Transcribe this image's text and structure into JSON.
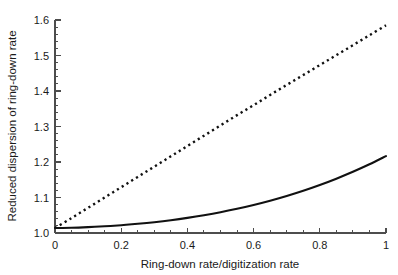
{
  "chart_data": {
    "type": "line",
    "title": "",
    "xlabel": "Ring-down rate/digitization rate",
    "ylabel": "Reduced dispersion of ring-down rate",
    "xlim": [
      0,
      1
    ],
    "ylim": [
      1.0,
      1.6
    ],
    "grid": false,
    "legend": "none",
    "x_ticks": [
      0,
      0.2,
      0.4,
      0.6,
      0.8,
      1
    ],
    "x_tick_labels": [
      "0",
      "0.2",
      "0.4",
      "0.6",
      "0.8",
      "1"
    ],
    "x_minor_step": 0.05,
    "y_ticks": [
      1.0,
      1.1,
      1.2,
      1.3,
      1.4,
      1.5,
      1.6
    ],
    "y_tick_labels": [
      "1.0",
      "1.1",
      "1.2",
      "1.3",
      "1.4",
      "1.5",
      "1.6"
    ],
    "y_minor_step": 0.02,
    "x": [
      0,
      0.05,
      0.1,
      0.15,
      0.2,
      0.25,
      0.3,
      0.35,
      0.4,
      0.45,
      0.5,
      0.55,
      0.6,
      0.65,
      0.7,
      0.75,
      0.8,
      0.85,
      0.9,
      0.95,
      1
    ],
    "series": [
      {
        "name": "upper-dotted",
        "style": "dotted",
        "color": "#111111",
        "values": [
          1.014,
          1.042,
          1.071,
          1.1,
          1.129,
          1.158,
          1.187,
          1.216,
          1.245,
          1.274,
          1.303,
          1.332,
          1.36,
          1.389,
          1.417,
          1.445,
          1.473,
          1.501,
          1.529,
          1.557,
          1.585
        ]
      },
      {
        "name": "lower-solid",
        "style": "solid",
        "color": "#111111",
        "values": [
          1.014,
          1.0147,
          1.0165,
          1.0189,
          1.022,
          1.0259,
          1.0305,
          1.036,
          1.0425,
          1.05,
          1.0585,
          1.0682,
          1.079,
          1.091,
          1.1043,
          1.119,
          1.1352,
          1.153,
          1.1724,
          1.1935,
          1.2165
        ]
      }
    ]
  },
  "axis": {
    "x_title": "Ring-down rate/digitization rate",
    "y_title": "Reduced dispersion of ring-down rate"
  }
}
